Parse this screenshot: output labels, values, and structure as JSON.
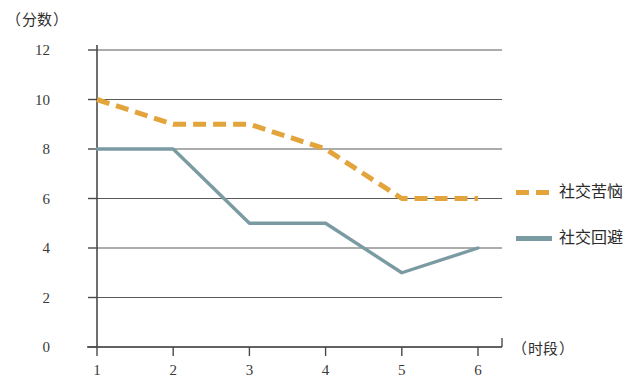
{
  "chart_data": {
    "type": "line",
    "title": "",
    "xlabel": "（时段）",
    "ylabel": "（分数）",
    "x": [
      1,
      2,
      3,
      4,
      5,
      6
    ],
    "categories": [
      "1",
      "2",
      "3",
      "4",
      "5",
      "6"
    ],
    "xtick_labels": [
      "1",
      "2",
      "3",
      "4",
      "5",
      "6"
    ],
    "ytick_labels": [
      "0",
      "2",
      "4",
      "6",
      "8",
      "10",
      "12"
    ],
    "ytick_values": [
      0,
      2,
      4,
      6,
      8,
      10,
      12
    ],
    "ylim": [
      0,
      12
    ],
    "xlim": [
      1,
      6
    ],
    "grid": "horizontal",
    "legend_position": "right",
    "series": [
      {
        "name": "社交苦恼",
        "color": "#E3A43C",
        "style": "dashed",
        "values": [
          10,
          9,
          9,
          8,
          6,
          6
        ]
      },
      {
        "name": "社交回避",
        "color": "#7B9BA3",
        "style": "solid",
        "values": [
          8,
          8,
          5,
          5,
          3,
          4
        ]
      }
    ]
  },
  "legend": {
    "items": [
      {
        "label": "社交苦恼",
        "color": "#E3A43C",
        "style": "dashed"
      },
      {
        "label": "社交回避",
        "color": "#7B9BA3",
        "style": "solid"
      }
    ]
  },
  "colors": {
    "distress": "#E3A43C",
    "avoidance": "#7B9BA3",
    "axis": "#4a4a4a",
    "grid": "#5a5a5a",
    "background": "#ffffff"
  }
}
